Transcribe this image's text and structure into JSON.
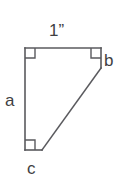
{
  "figure": {
    "stroke_color": "#5a5a5e",
    "label_color": "#3f3f43",
    "background_color": "#ffffff",
    "labels": {
      "top": "1”",
      "left": "a",
      "right": "b",
      "bottom": "c"
    },
    "vertices": {
      "top_left": [
        25,
        48
      ],
      "top_right": [
        101,
        48
      ],
      "right_lower": [
        101,
        68
      ],
      "diagonal_foot": [
        42,
        150
      ],
      "bottom_left": [
        25,
        150
      ]
    },
    "right_angle_marks": [
      "top-left",
      "top-right",
      "bottom-left"
    ],
    "edges": [
      "top-horizontal",
      "right-short-vertical",
      "diagonal",
      "bottom-horizontal",
      "left-vertical"
    ]
  }
}
